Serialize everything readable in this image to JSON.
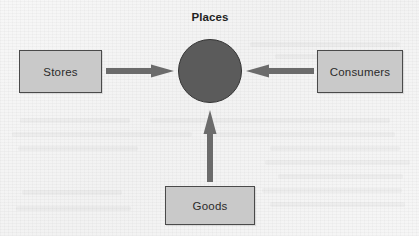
{
  "diagram": {
    "title": "Places",
    "title_position": {
      "x": 210,
      "y": 11
    },
    "background_color": "#f5f5f5",
    "box_fill_color": "#c9c9c9",
    "box_border_color": "#4a4a4a",
    "hub_fill_color": "#5b5b5b",
    "hub_border_color": "#343434",
    "arrow_color": "#6b6b6b",
    "hub": {
      "label": "",
      "shape": "circle",
      "cx": 210,
      "cy": 71,
      "r": 32
    },
    "nodes": [
      {
        "id": "stores",
        "label": "Stores",
        "x": 19,
        "y": 50,
        "w": 83,
        "h": 43
      },
      {
        "id": "consumers",
        "label": "Consumers",
        "x": 317,
        "y": 50,
        "w": 86,
        "h": 43
      },
      {
        "id": "goods",
        "label": "Goods",
        "x": 165,
        "y": 186,
        "w": 90,
        "h": 39
      }
    ],
    "arrows": [
      {
        "id": "stores-to-places",
        "from": "stores",
        "to": "hub",
        "direction": "right",
        "x": 106,
        "y": 64,
        "w": 68,
        "h": 14
      },
      {
        "id": "consumers-to-places",
        "from": "consumers",
        "to": "hub",
        "direction": "left",
        "x": 246,
        "y": 64,
        "w": 68,
        "h": 14
      },
      {
        "id": "goods-to-places",
        "from": "goods",
        "to": "hub",
        "direction": "up",
        "x": 203,
        "y": 110,
        "w": 14,
        "h": 72
      }
    ]
  }
}
